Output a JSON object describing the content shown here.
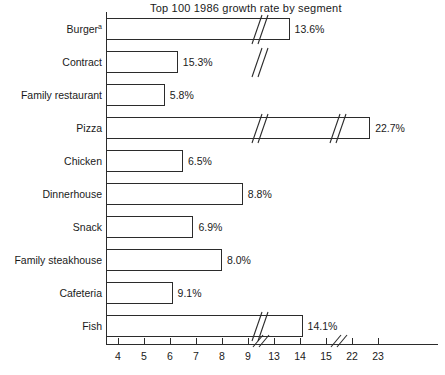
{
  "chart_data": {
    "type": "bar",
    "orientation": "horizontal",
    "title": "Top 100 1986 growth rate by segment",
    "xlabel": "",
    "ylabel": "",
    "categories": [
      "Burger",
      "Contract",
      "Family restaurant",
      "Pizza",
      "Chicken",
      "Dinnerhouse",
      "Snack",
      "Family steakhouse",
      "Cafeteria",
      "Fish"
    ],
    "category_footnote_markers": [
      "a",
      "",
      "",
      "",
      "",
      "",
      "",
      "",
      "",
      ""
    ],
    "values": [
      13.6,
      15.3,
      5.8,
      22.7,
      6.5,
      8.8,
      6.9,
      8.0,
      9.1,
      14.1
    ],
    "value_labels": [
      "13.6%",
      "15.3%",
      "5.8%",
      "22.7%",
      "6.5%",
      "8.8%",
      "6.9%",
      "8.0%",
      "9.1%",
      "14.1%"
    ],
    "xticks": [
      4,
      5,
      6,
      7,
      8,
      9,
      13,
      14,
      15,
      22,
      23
    ],
    "xtick_labels": [
      "4",
      "5",
      "6",
      "7",
      "8",
      "9",
      "13",
      "14",
      "15",
      "22",
      "23"
    ],
    "axis_breaks": [
      {
        "between": [
          9,
          13
        ]
      },
      {
        "between": [
          15,
          22
        ]
      }
    ],
    "bar_break_counts": [
      1,
      1,
      0,
      2,
      0,
      0,
      0,
      0,
      0,
      1
    ],
    "xlim": [
      3.5,
      23.3
    ],
    "grid": false,
    "legend": null,
    "bar_fill": "#ffffff",
    "bar_stroke": "#2b2b2b",
    "axis_color": "#2b2b2b",
    "text_color": "#1a1a1a"
  }
}
